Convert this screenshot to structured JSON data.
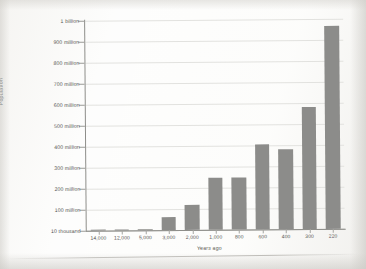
{
  "chart_data": {
    "type": "bar",
    "title": "",
    "xlabel": "Years ago",
    "ylabel": "Population",
    "categories": [
      "14,000",
      "12,000",
      "5,000",
      "3,000",
      "2,000",
      "1,000",
      "800",
      "600",
      "400",
      "300",
      "220"
    ],
    "values": [
      1500000,
      2500000,
      5000000,
      60000000,
      120000000,
      250000000,
      250000000,
      405000000,
      380000000,
      580000000,
      690000000
    ],
    "values_display": [
      1500000,
      2500000,
      5000000,
      60000000,
      120000000,
      250000000,
      250000000,
      405000000,
      380000000,
      580000000,
      690000000
    ],
    "bar_values": [
      1500000,
      2500000,
      5000000,
      60000000,
      120000000,
      250000000,
      250000000,
      405000000,
      380000000,
      580000000,
      965000000
    ],
    "ytick_labels": [
      "1 billion",
      "900 million",
      "800 million",
      "700 million",
      "600 million",
      "500 million",
      "400 million",
      "300 million",
      "200 million",
      "100 million",
      "10 thousand"
    ],
    "ytick_values": [
      1000000000,
      900000000,
      800000000,
      700000000,
      600000000,
      500000000,
      400000000,
      300000000,
      200000000,
      100000000,
      10000
    ],
    "ylim": [
      10000,
      1000000000
    ],
    "grid": true,
    "legend": "none",
    "bar_color": "#8c8c8a",
    "grid_color": "#e2e2df",
    "axis_color": "#8e8e8a"
  },
  "axes": {
    "y_title": "Population",
    "x_title": "Years ago"
  }
}
